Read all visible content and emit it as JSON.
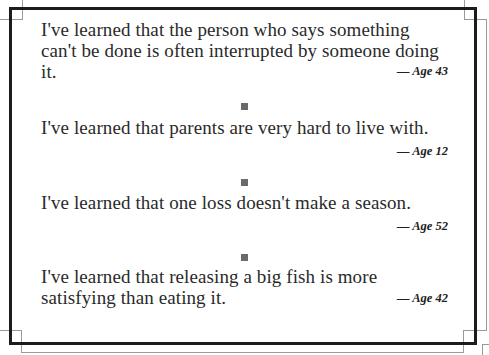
{
  "quotes": [
    {
      "text": "I've learned that the person who says something can't be done is often interrupted by someone doing it.",
      "attribution": "— Age 43"
    },
    {
      "text": "I've learned that parents are very hard to live with.",
      "attribution": "— Age 12"
    },
    {
      "text": "I've learned that one loss doesn't make a season.",
      "attribution": "— Age 52"
    },
    {
      "text": "I've learned that releasing a big fish is more satisfying than eating it.",
      "attribution": "— Age 42"
    }
  ],
  "separator": {
    "shape": "square",
    "color": "#6a6a6a"
  },
  "frame": {
    "border_color": "#1c1c1c",
    "accent_line_color": "#9a9a9a"
  }
}
